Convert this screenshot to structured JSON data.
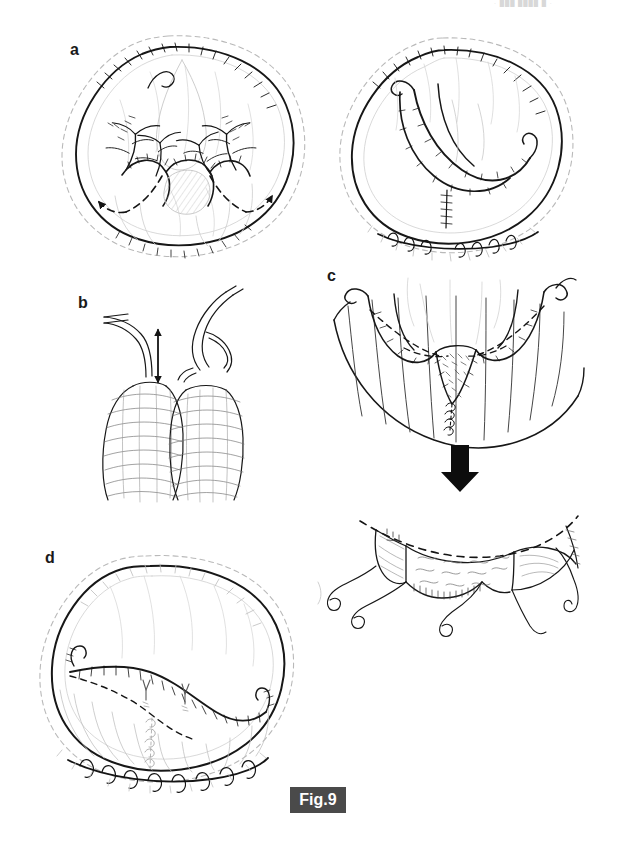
{
  "figure": {
    "id": "Fig.9",
    "badge_label": "Fig.9",
    "badge_bg_color": "#4a4a4a",
    "badge_text_color": "#ffffff",
    "background_color": "#ffffff",
    "ink_color": "#1a1a1a",
    "width_px": 625,
    "height_px": 843,
    "type": "surgical-technique-line-drawing"
  },
  "header": {
    "cropped_text_fragment": "·  ███ ████ █  ·"
  },
  "panels": [
    {
      "key": "a",
      "label": "a",
      "label_x": 70,
      "label_y": 42,
      "caption": "Two oval tissue mounds drawn in hand-inked line art: left view shows a de-epithelialized dome with branching vascular pedicles fanning inward and two dashed incision lines ending in solid arrowheads pointing laterally; right view shows the same dome after mobilization with the flap folded inward and a transverse suture line closing the inferior pole.",
      "views": [
        {
          "name": "left-preoperative-markings",
          "features": [
            "outer dashed skin envelope outline",
            "inner solid dome contour with hatched shading along upper border",
            "symmetric branching vascular trees (left and right pedicles)",
            "central nipple-areola mound",
            "two dashed curved incision lines",
            "two solid arrowheads indicating direction of flap rotation"
          ]
        },
        {
          "name": "right-after-flap-mobilization",
          "features": [
            "outer dashed skin envelope outline",
            "inner solid dome contour",
            "inward-folded flap with two curved limbs meeting centrally",
            "vertical midline suture line",
            "transverse inframammary suture line with interrupted stitch marks"
          ]
        }
      ]
    },
    {
      "key": "b",
      "label": "b",
      "label_x": 78,
      "label_y": 295,
      "caption": "Detail of two adjacent vascular pedicles with their cone-shaped tissue bases; a vertical double-headed arrow between them indicates the gap / length discrepancy to be corrected.",
      "features": [
        "left pedicle: single slender vessel descending to a hatched conical base",
        "right pedicle: branched vessel with a side branch descending to a hatched conical base",
        "vertical double-headed arrow marking the inter-pedicle distance"
      ],
      "annotations": [
        {
          "name": "distance-arrow",
          "type": "double-headed-arrow",
          "orientation": "vertical"
        }
      ]
    },
    {
      "key": "c",
      "label": "c",
      "label_x": 327,
      "label_y": 268,
      "caption": "Inferior oblique view of the lower pole: the curved chest-wall margin carries radiating parallel lines, with two lateral flap limbs turned up on either side of a central stippled pedicle, and dashed lines marking the planned resection borders. A short vertical suture row descends at the midline.",
      "features": [
        "curved inferior chest-wall contour",
        "radiating parallel skin-tension lines",
        "two lateral flap limbs with hooked vessel ends",
        "central stippled / hatched pedicle area",
        "dashed resection borders on both sides",
        "vertical midline interrupted suture row"
      ]
    },
    {
      "key": "c-result",
      "label": "",
      "caption": "Result below the transition arrow: the mobilized lower-pole flap seen from below, hanging free with long curled suture tails at four points; a long dashed line marks the upper cut edge and wavy shading indicates the undersurface of the dermal flap.",
      "features": [
        "long dashed superior cut-edge line",
        "central wavy-shaded dermal flap undersurface",
        "two lateral beveled flap wedges",
        "four long curled suture tails"
      ]
    },
    {
      "key": "d",
      "label": "d",
      "label_x": 45,
      "label_y": 550,
      "caption": "Final result: the reshaped oval breast mound seen obliquely, with the outer dashed skin envelope, a bold repositioned upper flap border, two small Y-shaped vessel stumps on the mound surface, a dashed lower-pole marking, and a long inframammary suture line with interrupted stitch marks across the base.",
      "features": [
        "outer dashed skin envelope",
        "bold repositioned upper flap border",
        "two small Y-shaped vessel stumps",
        "dashed lower-pole marking line",
        "radiating lower-pole tension lines",
        "inframammary suture line with interrupted stitch marks"
      ]
    }
  ],
  "transition_arrow": {
    "name": "downward-transition-arrow",
    "direction": "down",
    "style": "solid-bold-black",
    "x": 460,
    "y": 467
  }
}
